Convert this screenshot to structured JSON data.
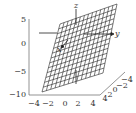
{
  "chart_data": {
    "type": "surface3d",
    "title": "",
    "axes": {
      "x": {
        "label": "x",
        "ticks": [
          "-4",
          "-2",
          "0",
          "2",
          "4"
        ],
        "range": [
          -4,
          4
        ]
      },
      "y": {
        "label": "y",
        "ticks": [
          "4",
          "2",
          "0",
          "-2",
          "-4"
        ],
        "range": [
          -4,
          4
        ]
      },
      "z": {
        "label": "z",
        "ticks": [
          "5",
          "0",
          "-5",
          "-10"
        ],
        "range": [
          -10,
          5
        ]
      }
    },
    "surface": {
      "kind": "plane",
      "mesh": "wireframe",
      "grid_lines_u": 14,
      "grid_lines_v": 14,
      "color": "#222222"
    },
    "grid": false,
    "legend": null
  },
  "labels": {
    "z_ticks": [
      "5",
      "0",
      "−5",
      "−10"
    ],
    "x_ticks": [
      "−4",
      "−2",
      "0",
      "2",
      "4"
    ],
    "y_ticks": [
      "4",
      "2",
      "0",
      "−2",
      "−4"
    ],
    "axis_z": "z",
    "axis_y": "y",
    "axis_x": "x"
  },
  "colors": {
    "line": "#222222",
    "axis": "#555555",
    "background": "#ffffff"
  }
}
